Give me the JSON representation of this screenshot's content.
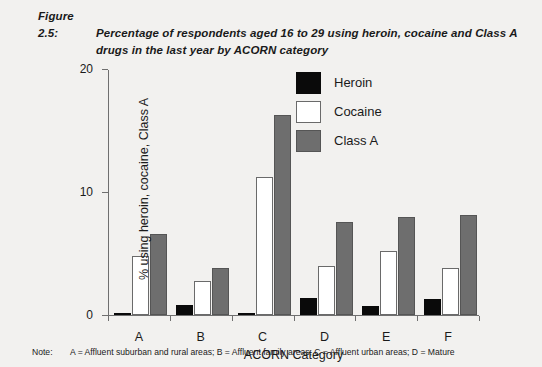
{
  "figure": {
    "number": "Figure 2.5:",
    "title_line1": "Percentage of respondents aged 16 to 29 using heroin, cocaine and Class A",
    "title_line2": "drugs in the last year by ACORN category"
  },
  "legend": {
    "position": "top-center-right",
    "items": [
      {
        "label": "Heroin",
        "color": "#0a0a0a",
        "swatch": "heroin"
      },
      {
        "label": "Cocaine",
        "color": "#ffffff",
        "swatch": "cocaine"
      },
      {
        "label": "Class A",
        "color": "#6e6e6e",
        "swatch": "classa"
      }
    ]
  },
  "note": {
    "key": "Note:",
    "text": "A = Affluent suburban and rural areas; B = Affluent family areas; C = Affluent urban areas; D = Mature"
  },
  "chart_data": {
    "type": "bar",
    "title": "Percentage of respondents aged 16 to 29 using heroin, cocaine and Class A drugs in the last year by ACORN category",
    "xlabel": "ACORN Category",
    "ylabel": "% using heroin, cocaine, Class A",
    "categories": [
      "A",
      "B",
      "C",
      "D",
      "E",
      "F"
    ],
    "ylim": [
      0,
      20
    ],
    "yticks": [
      0,
      10,
      20
    ],
    "ytick_labels": [
      "0",
      "10",
      "20"
    ],
    "grid": false,
    "series": [
      {
        "name": "Heroin",
        "color": "#0a0a0a",
        "values": [
          0.05,
          0.8,
          0.2,
          1.4,
          0.7,
          1.3
        ]
      },
      {
        "name": "Cocaine",
        "color": "#ffffff",
        "values": [
          4.8,
          2.8,
          11.2,
          4.0,
          5.2,
          3.8
        ]
      },
      {
        "name": "Class A",
        "color": "#6e6e6e",
        "values": [
          6.6,
          3.8,
          16.3,
          7.6,
          8.0,
          8.1
        ]
      }
    ]
  }
}
